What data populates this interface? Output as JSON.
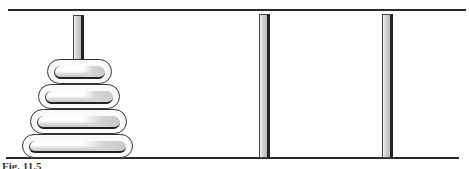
{
  "figure": {
    "caption": "Fig. 11.5",
    "colors": {
      "line": "#2a2a2a",
      "peg_shade": "#bdbdbd",
      "disk_outline": "#333333"
    },
    "pegs": [
      {
        "name": "peg-left",
        "disks": 4
      },
      {
        "name": "peg-middle",
        "disks": 0
      },
      {
        "name": "peg-right",
        "disks": 0
      }
    ],
    "disks": [
      {
        "size": 1,
        "label": "smallest"
      },
      {
        "size": 2,
        "label": "small"
      },
      {
        "size": 3,
        "label": "medium"
      },
      {
        "size": 4,
        "label": "largest"
      }
    ]
  }
}
